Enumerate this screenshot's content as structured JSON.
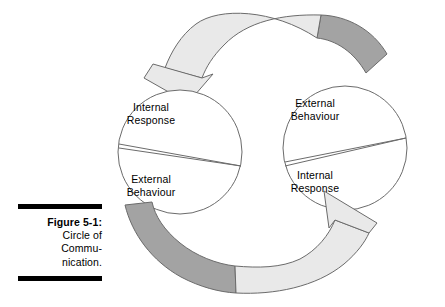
{
  "figure": {
    "caption": {
      "label": "Figure 5-1:",
      "lines": [
        "Circle of",
        "Commu-",
        "nication."
      ]
    },
    "diagram": {
      "title": "Circle of Communication",
      "left_circle": {
        "name": "left-circle",
        "top_segment_label": "Internal\nResponse",
        "bottom_segment_label": "External\nBehaviour"
      },
      "right_circle": {
        "name": "right-circle",
        "top_segment_label": "External\nBehaviour",
        "bottom_segment_label": "Internal\nResponse"
      },
      "arrows": [
        {
          "name": "top-arrow",
          "from": "right-circle",
          "to": "left-circle",
          "direction": "right-to-left-over-top",
          "head_points": "down",
          "fill_light": "#e9e9e9",
          "fill_dark": "#a3a3a3"
        },
        {
          "name": "bottom-arrow",
          "from": "left-circle",
          "to": "right-circle",
          "direction": "left-to-right-under-bottom",
          "head_points": "up",
          "fill_light": "#e9e9e9",
          "fill_dark": "#a3a3a3"
        }
      ]
    },
    "colors": {
      "stroke": "#6b6b6b",
      "rule": "#000000",
      "text": "#000000",
      "background": "#ffffff",
      "arrow_light": "#e9e9e9",
      "arrow_dark": "#a3a3a3"
    }
  }
}
